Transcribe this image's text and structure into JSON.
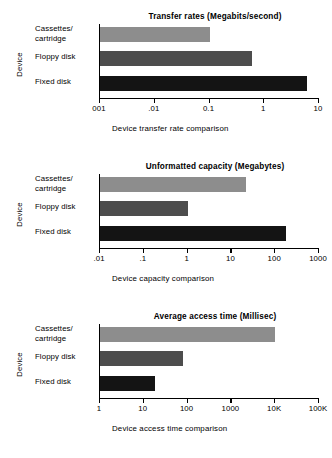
{
  "figure": {
    "ylabel": "Device",
    "categories": [
      "Cassettes/\ncartridge",
      "Floppy disk",
      "Fixed disk"
    ],
    "colors": {
      "cassettes": "#8d8d8d",
      "floppy": "#4d4d4d",
      "fixed": "#141414",
      "axis": "#000000",
      "background": "#ffffff"
    }
  },
  "chart_data": [
    {
      "type": "bar",
      "orientation": "horizontal",
      "title": "Transfer rates (Megabits/second)",
      "xlabel": "Device transfer rate comparison",
      "ylabel": "Device",
      "xscale": "log",
      "xlim": [
        0.001,
        10
      ],
      "tick_labels": [
        "001",
        ".01",
        "0.1",
        "1",
        "10"
      ],
      "tick_values": [
        0.001,
        0.01,
        0.1,
        1,
        10
      ],
      "grid": false,
      "legend": "none",
      "categories": [
        "Cassettes/cartridge",
        "Floppy disk",
        "Fixed disk"
      ],
      "values": [
        0.1,
        0.6,
        6
      ],
      "value_units": "Megabits/second"
    },
    {
      "type": "bar",
      "orientation": "horizontal",
      "title": "Unformatted capacity (Megabytes)",
      "xlabel": "Device capacity comparison",
      "ylabel": "Device",
      "xscale": "log",
      "xlim": [
        0.01,
        1000
      ],
      "tick_labels": [
        ".01",
        ".1",
        "1",
        "10",
        "100",
        "1000"
      ],
      "tick_values": [
        0.01,
        0.1,
        1,
        10,
        100,
        1000
      ],
      "grid": false,
      "legend": "none",
      "categories": [
        "Cassettes/cartridge",
        "Floppy disk",
        "Fixed disk"
      ],
      "values": [
        22,
        1,
        180
      ],
      "value_units": "Megabytes"
    },
    {
      "type": "bar",
      "orientation": "horizontal",
      "title": "Average access time (Millisec)",
      "xlabel": "Device access time comparison",
      "ylabel": "Device",
      "xscale": "log",
      "xlim": [
        1,
        100000
      ],
      "tick_labels": [
        "1",
        "10",
        "100",
        "1000",
        "10K",
        "100K"
      ],
      "tick_values": [
        1,
        10,
        100,
        1000,
        10000,
        100000
      ],
      "grid": false,
      "legend": "none",
      "categories": [
        "Cassettes/cartridge",
        "Floppy disk",
        "Fixed disk"
      ],
      "values": [
        10000,
        80,
        18
      ],
      "value_units": "Millisec"
    }
  ]
}
